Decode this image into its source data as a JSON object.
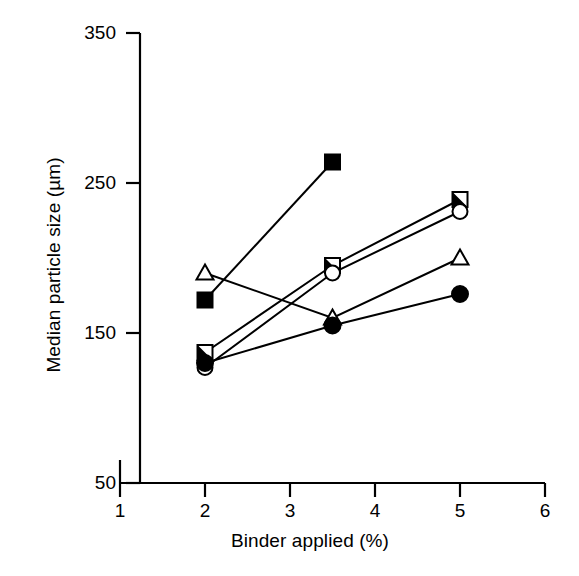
{
  "chart_data": {
    "type": "line",
    "title": "",
    "xlabel": "Binder applied (%)",
    "ylabel": "Median particle size (µm)",
    "xlim": [
      1,
      6
    ],
    "ylim": [
      50,
      350
    ],
    "xticks": [
      "1",
      "2",
      "3",
      "4",
      "5",
      "6"
    ],
    "yticks": [
      "50",
      "150",
      "250",
      "350"
    ],
    "grid": false,
    "legend": "none",
    "series": [
      {
        "name": "filled-square",
        "marker": "filled-square",
        "x": [
          2.0,
          3.5
        ],
        "values": [
          172,
          264
        ]
      },
      {
        "name": "open-triangle",
        "marker": "open-triangle",
        "x": [
          2.0,
          3.5,
          5.0
        ],
        "values": [
          190,
          160,
          200
        ]
      },
      {
        "name": "half-filled-square",
        "marker": "half-filled-square",
        "x": [
          2.0,
          3.5,
          5.0
        ],
        "values": [
          137,
          195,
          239
        ]
      },
      {
        "name": "open-circle",
        "marker": "open-circle",
        "x": [
          2.0,
          3.5,
          5.0
        ],
        "values": [
          127,
          190,
          231
        ]
      },
      {
        "name": "filled-circle",
        "marker": "filled-circle",
        "x": [
          2.0,
          3.5,
          5.0
        ],
        "values": [
          130,
          155,
          176
        ]
      }
    ]
  },
  "axes": {
    "y_title": "Median particle size (µm)",
    "x_title": "Binder applied (%)",
    "y_tick_labels": [
      "350",
      "250",
      "150",
      "50"
    ],
    "x_tick_labels": [
      "1",
      "2",
      "3",
      "4",
      "5",
      "6"
    ]
  },
  "colors": {
    "line": "#000000",
    "marker_fill": "#000000",
    "marker_open": "#ffffff",
    "background": "#ffffff"
  }
}
